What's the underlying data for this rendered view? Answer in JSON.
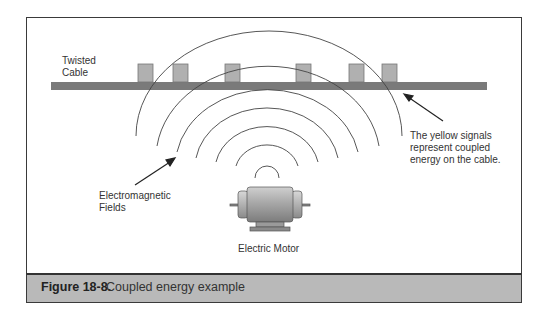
{
  "figure": {
    "number": "Figure 18-8.",
    "caption": "Coupled energy example"
  },
  "labels": {
    "cable_line1": "Twisted",
    "cable_line2": "Cable",
    "signals_line1": "The yellow signals",
    "signals_line2": "represent coupled",
    "signals_line3": "energy on the cable.",
    "fields_line1": "Electromagnetic",
    "fields_line2": "Fields",
    "motor": "Electric Motor"
  },
  "colors": {
    "cable": "#7a7a7a",
    "signal_box": "#b0b0b0",
    "caption_band": "#b9b9b9",
    "frame": "#3a3a3a"
  },
  "signals": {
    "count": 6,
    "x_positions": [
      138,
      173,
      225,
      296,
      349,
      382
    ]
  }
}
